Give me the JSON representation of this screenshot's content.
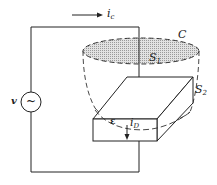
{
  "diagram": {
    "title": "",
    "labels": {
      "conduction_current": "i",
      "conduction_current_sub": "c",
      "curve": "C",
      "surface1": "S",
      "surface1_sub": "1",
      "surface2": "S",
      "surface2_sub": "2",
      "source_voltage": "v",
      "source_symbol": "~",
      "permittivity": "ε",
      "displacement_current": "i",
      "displacement_current_sub": "D"
    },
    "components": [
      {
        "id": "ac-source",
        "type": "voltage-source",
        "label": "v"
      },
      {
        "id": "capacitor",
        "type": "parallel-plate-capacitor",
        "dielectric": "ε"
      },
      {
        "id": "surface-s1",
        "type": "flat-surface",
        "label": "S1",
        "bounded_by": "C"
      },
      {
        "id": "surface-s2",
        "type": "bag-surface",
        "label": "S2",
        "bounded_by": "C"
      }
    ],
    "colors": {
      "line": "#222222",
      "surface_fill": "#cfcfcf",
      "background": "#ffffff"
    }
  }
}
